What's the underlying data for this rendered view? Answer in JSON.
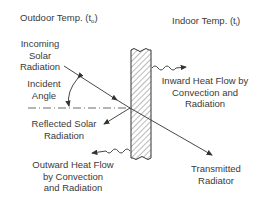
{
  "diagram": {
    "type": "heat transfer through glass",
    "outdoor": {
      "label": "Outdoor Temp. (t",
      "subscript": "o",
      "close": ")"
    },
    "indoor": {
      "label": "Indoor Temp. (t",
      "subscript": "i",
      "close": ")"
    },
    "labels": {
      "incoming": [
        "Incoming",
        "Solar",
        "Radiation"
      ],
      "incident": [
        "Incident",
        "Angle"
      ],
      "reflected": [
        "Reflected Solar",
        "Radiation"
      ],
      "outward": [
        "Outward Heat Flow",
        "by Convection",
        "and Radiation"
      ],
      "inward": [
        "Inward Heat Flow by",
        "Convection and",
        "Radiation"
      ],
      "transmitted": [
        "Transmitted",
        "Radiator"
      ]
    },
    "colors": {
      "line": "#3a3a3a",
      "background": "#ffffff"
    }
  }
}
